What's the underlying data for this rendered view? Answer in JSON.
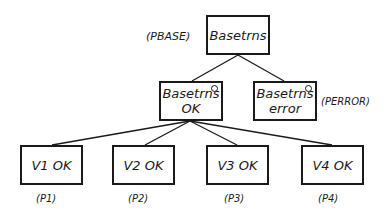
{
  "diagram": {
    "root": {
      "label": "Basetrns",
      "tag": "(PBASE)"
    },
    "level2": [
      {
        "line1": "Basetrns",
        "line2": "OK",
        "has_circle": true,
        "tag": ""
      },
      {
        "line1": "Basetrns",
        "line2": "error",
        "has_circle": true,
        "tag": "(PERROR)"
      }
    ],
    "leaves": [
      {
        "label": "V1 OK",
        "tag": "(P1)"
      },
      {
        "label": "V2 OK",
        "tag": "(P2)"
      },
      {
        "label": "V3 OK",
        "tag": "(P3)"
      },
      {
        "label": "V4 OK",
        "tag": "(P4)"
      }
    ],
    "edges": [
      [
        "Basetrns",
        "Basetrns OK"
      ],
      [
        "Basetrns",
        "Basetrns error"
      ],
      [
        "Basetrns OK",
        "V1 OK"
      ],
      [
        "Basetrns OK",
        "V2 OK"
      ],
      [
        "Basetrns OK",
        "V3 OK"
      ],
      [
        "Basetrns OK",
        "V4 OK"
      ]
    ]
  }
}
